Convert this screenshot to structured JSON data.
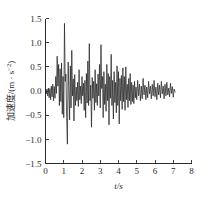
{
  "chart_data": {
    "type": "line",
    "title": "",
    "xlabel": "t/s",
    "ylabel_text": "加速度/(m · s",
    "ylabel_sup": "-2",
    "ylabel_tail": ")",
    "ylabel_full": "加速度/(m · s⁻²)",
    "xlim": [
      0,
      8
    ],
    "ylim": [
      -1.5,
      1.5
    ],
    "x_ticks": [
      0,
      1,
      2,
      3,
      4,
      5,
      6,
      7,
      8
    ],
    "x_tick_labels": [
      "0",
      "1",
      "2",
      "3",
      "4",
      "5",
      "6",
      "7",
      "8"
    ],
    "y_ticks": [
      -1.5,
      -1.0,
      -0.5,
      0.0,
      0.5,
      1.0,
      1.5
    ],
    "y_tick_labels": [
      "-1.5",
      "-1.0",
      "-0.5",
      "0.0",
      "0.5",
      "1.0",
      "1.5"
    ],
    "grid": false,
    "legend": null,
    "line_color": "#262626",
    "series": [
      {
        "name": "acceleration",
        "x": [
          0.0,
          0.04,
          0.08,
          0.12,
          0.16,
          0.2,
          0.24,
          0.28,
          0.32,
          0.36,
          0.4,
          0.44,
          0.48,
          0.52,
          0.56,
          0.6,
          0.64,
          0.68,
          0.72,
          0.76,
          0.8,
          0.84,
          0.88,
          0.92,
          0.96,
          1.0,
          1.04,
          1.08,
          1.12,
          1.16,
          1.2,
          1.24,
          1.28,
          1.32,
          1.36,
          1.4,
          1.44,
          1.48,
          1.52,
          1.56,
          1.6,
          1.64,
          1.68,
          1.72,
          1.76,
          1.8,
          1.84,
          1.88,
          1.92,
          1.96,
          2.0,
          2.04,
          2.08,
          2.12,
          2.16,
          2.2,
          2.24,
          2.28,
          2.32,
          2.36,
          2.4,
          2.44,
          2.48,
          2.52,
          2.56,
          2.6,
          2.64,
          2.68,
          2.72,
          2.76,
          2.8,
          2.84,
          2.88,
          2.92,
          2.96,
          3.0,
          3.04,
          3.08,
          3.12,
          3.16,
          3.2,
          3.24,
          3.28,
          3.32,
          3.36,
          3.4,
          3.44,
          3.48,
          3.52,
          3.56,
          3.6,
          3.64,
          3.68,
          3.72,
          3.76,
          3.8,
          3.84,
          3.88,
          3.92,
          3.96,
          4.0,
          4.04,
          4.08,
          4.12,
          4.16,
          4.2,
          4.24,
          4.28,
          4.32,
          4.36,
          4.4,
          4.44,
          4.48,
          4.52,
          4.56,
          4.6,
          4.64,
          4.68,
          4.72,
          4.76,
          4.8,
          4.84,
          4.88,
          4.92,
          4.96,
          5.0,
          5.05,
          5.1,
          5.15,
          5.2,
          5.25,
          5.3,
          5.35,
          5.4,
          5.45,
          5.5,
          5.55,
          5.6,
          5.65,
          5.7,
          5.75,
          5.8,
          5.85,
          5.9,
          5.95,
          6.0,
          6.05,
          6.1,
          6.15,
          6.2,
          6.25,
          6.3,
          6.35,
          6.4,
          6.45,
          6.5,
          6.55,
          6.6,
          6.65,
          6.7,
          6.75,
          6.8,
          6.85,
          6.9,
          6.95,
          7.0,
          7.05,
          7.1
        ],
        "y": [
          0.02,
          -0.06,
          0.04,
          -0.1,
          0.06,
          -0.14,
          0.05,
          -0.18,
          0.1,
          -0.12,
          0.14,
          -0.2,
          0.09,
          -0.15,
          0.3,
          -0.05,
          0.72,
          0.1,
          0.55,
          -0.3,
          0.46,
          -0.22,
          0.58,
          -0.48,
          0.3,
          -0.55,
          1.4,
          0.2,
          0.35,
          -0.55,
          -1.1,
          0.6,
          0.05,
          -0.6,
          0.52,
          -0.35,
          0.84,
          -0.1,
          0.25,
          -0.62,
          0.34,
          -0.3,
          0.08,
          -0.2,
          0.18,
          -0.32,
          0.44,
          -0.18,
          0.1,
          -0.26,
          0.3,
          -0.1,
          0.16,
          -0.4,
          0.22,
          -0.55,
          0.36,
          -0.25,
          0.62,
          -0.3,
          0.98,
          -0.2,
          0.12,
          -0.75,
          0.28,
          -0.15,
          0.2,
          -0.4,
          0.44,
          -0.24,
          0.15,
          -0.3,
          0.35,
          -0.1,
          0.55,
          -0.35,
          0.96,
          0.05,
          0.3,
          -0.55,
          0.4,
          -0.28,
          0.14,
          -0.42,
          0.55,
          -0.2,
          0.36,
          -0.7,
          0.3,
          -0.15,
          0.76,
          -0.3,
          0.22,
          -0.58,
          0.4,
          -0.24,
          0.18,
          -0.45,
          0.52,
          -0.3,
          0.4,
          -0.68,
          0.26,
          -0.2,
          0.32,
          -0.38,
          0.48,
          -0.22,
          0.3,
          -0.4,
          0.5,
          -0.18,
          0.14,
          -0.34,
          0.26,
          -0.2,
          0.36,
          -0.28,
          0.18,
          -0.22,
          0.12,
          -0.26,
          0.2,
          -0.14,
          0.08,
          -0.18,
          0.22,
          -0.1,
          0.14,
          -0.2,
          0.1,
          -0.16,
          0.26,
          -0.08,
          0.12,
          -0.18,
          0.08,
          -0.14,
          0.2,
          -0.06,
          0.1,
          -0.16,
          0.14,
          -0.1,
          0.22,
          -0.12,
          0.08,
          -0.18,
          0.16,
          -0.08,
          0.12,
          -0.14,
          0.2,
          -0.06,
          0.1,
          -0.16,
          0.14,
          -0.1,
          0.18,
          -0.08,
          0.06,
          -0.12,
          0.16,
          -0.05,
          0.09,
          -0.13,
          0.04,
          -0.02
        ]
      }
    ]
  }
}
